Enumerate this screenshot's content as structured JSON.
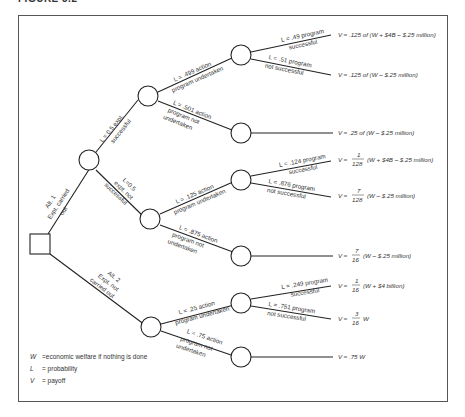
{
  "figure": {
    "title": "FIGURE 3.2"
  },
  "decision_node": {
    "label": "decision"
  },
  "branches": {
    "alt1": {
      "line1": "Alt. 1",
      "line2": "Expt. carried",
      "line3": "out"
    },
    "alt2": {
      "line1": "Alt. 2",
      "line2": "Expt. not",
      "line3": "carried out"
    },
    "expt_success": {
      "line1": "L = 0.5 expt.",
      "line2": "successful"
    },
    "expt_fail": {
      "line1": "L=0.5",
      "line2": "expt. not",
      "line3": "successful"
    },
    "a_action": {
      "line1": "L = .499 action",
      "line2": "program undertaken"
    },
    "a_noaction": {
      "line1": "L = .501 action",
      "line2": "program not",
      "line3": "undertaken"
    },
    "a_succ": {
      "line1": "L = .49 program",
      "line2": "successful"
    },
    "a_fail": {
      "line1": "L = .51 program",
      "line2": "not successful"
    },
    "b_action": {
      "line1": "L = .125 action",
      "line2": "program undertaken"
    },
    "b_noaction": {
      "line1": "L = .875 action",
      "line2": "program not",
      "line3": "undertaken"
    },
    "b_succ": {
      "line1": "L = .124 program",
      "line2": "successful"
    },
    "b_fail": {
      "line1": "L = .876 program",
      "line2": "not successful"
    },
    "c_action": {
      "line1": "L = .25 action",
      "line2": "program undertaken"
    },
    "c_noaction": {
      "line1": "L = .75 action",
      "line2": "program not",
      "line3": "undertaken"
    },
    "c_succ": {
      "line1": "L = .249 program",
      "line2": "successful"
    },
    "c_fail": {
      "line1": "L = .751 program",
      "line2": "not successful"
    }
  },
  "payoffs": [
    {
      "id": "p1",
      "text": "V ≈ .125 of (W + $4B – $.25 million)"
    },
    {
      "id": "p2",
      "text": "V ≈ .125 of (W – $.25 million)"
    },
    {
      "id": "p3",
      "text": "V ≈ .25 of (W – $.25 million)"
    },
    {
      "id": "p4",
      "prefix": "V ≈",
      "num": "1",
      "den": "128",
      "suffix": "(W + $4B – $.25 million)"
    },
    {
      "id": "p5",
      "prefix": "V ≈",
      "num": "7",
      "den": "128",
      "suffix": "(W – $.25 million)"
    },
    {
      "id": "p6",
      "prefix": "V ≈",
      "num": "7",
      "den": "16",
      "suffix": "(W – $.25 million)"
    },
    {
      "id": "p7",
      "prefix": "V ≈",
      "num": "1",
      "den": "16",
      "suffix": "(W + $4 billion)"
    },
    {
      "id": "p8",
      "prefix": "V ≈",
      "num": "3",
      "den": "16",
      "suffix": "W"
    },
    {
      "id": "p9",
      "text": "V ≈ .75 W"
    }
  ],
  "legend": [
    {
      "key": "W",
      "desc": "=economic welfare if nothing is done"
    },
    {
      "key": "L",
      "desc": "= probability"
    },
    {
      "key": "V",
      "desc": "= payoff"
    }
  ]
}
